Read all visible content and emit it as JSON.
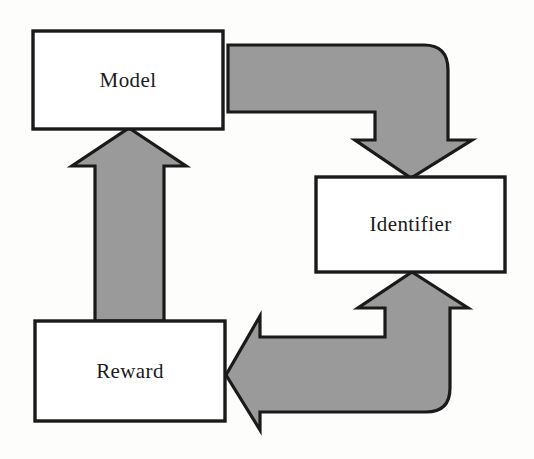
{
  "diagram": {
    "type": "flow-cycle",
    "background_color": "#fdfdfc",
    "node_fill": "#ffffff",
    "node_stroke": "#1a1a1a",
    "arrow_fill": "#9a9a9a",
    "arrow_stroke": "#1a1a1a",
    "nodes": [
      {
        "id": "model",
        "label": "Model",
        "shape": "rectangle",
        "x": 33,
        "y": 31,
        "width": 190,
        "height": 98
      },
      {
        "id": "identifier",
        "label": "Identifier",
        "shape": "rectangle",
        "x": 316,
        "y": 177,
        "width": 189,
        "height": 95
      },
      {
        "id": "reward",
        "label": "Reward",
        "shape": "rectangle",
        "x": 35,
        "y": 321,
        "width": 190,
        "height": 100
      }
    ],
    "arrows": [
      {
        "id": "model-to-identifier",
        "from": "model",
        "to": "identifier",
        "style": "elbow-rounded-block-arrow",
        "direction": "right-then-down",
        "head": "down"
      },
      {
        "id": "identifier-to-reward",
        "from": "identifier",
        "to": "reward",
        "style": "elbow-rounded-block-arrow",
        "direction": "down-then-left",
        "head": "left",
        "tail_head": "up"
      },
      {
        "id": "reward-to-model",
        "from": "reward",
        "to": "model",
        "style": "straight-block-arrow",
        "direction": "up",
        "head": "up"
      }
    ]
  }
}
